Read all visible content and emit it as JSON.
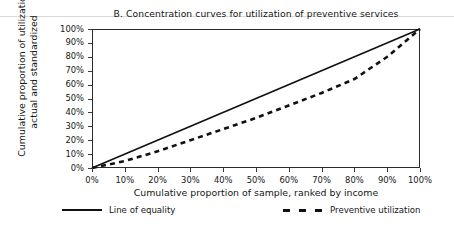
{
  "chart_data": {
    "type": "line",
    "title": "B.  Concentration curves for utilization of preventive services",
    "xlabel": "Cumulative proportion of sample, ranked by income",
    "ylabel_line1": "Cumulative proportion of utilization,",
    "ylabel_line2": "actual and standardized",
    "xlim": [
      0,
      100
    ],
    "ylim": [
      0,
      100
    ],
    "grid": false,
    "legend_position": "bottom",
    "xticks": [
      "0%",
      "10%",
      "20%",
      "30%",
      "40%",
      "50%",
      "60%",
      "70%",
      "80%",
      "90%",
      "100%"
    ],
    "yticks": [
      "0%",
      "10%",
      "20%",
      "30%",
      "40%",
      "50%",
      "60%",
      "70%",
      "80%",
      "90%",
      "100%"
    ],
    "xtick_values": [
      0,
      10,
      20,
      30,
      40,
      50,
      60,
      70,
      80,
      90,
      100
    ],
    "ytick_values": [
      0,
      10,
      20,
      30,
      40,
      50,
      60,
      70,
      80,
      90,
      100
    ],
    "series": [
      {
        "name": "Line of equality",
        "style": "solid",
        "color": "#111111",
        "x": [
          0,
          100
        ],
        "values": [
          0,
          100
        ]
      },
      {
        "name": "Preventive utilization",
        "style": "dashed",
        "color": "#111111",
        "x": [
          0,
          10,
          20,
          30,
          40,
          50,
          60,
          70,
          80,
          90,
          100
        ],
        "values": [
          0,
          5,
          12,
          20,
          28,
          36,
          45,
          54,
          64,
          80,
          100
        ]
      }
    ]
  },
  "legend": {
    "items": [
      {
        "label": "Line of equality"
      },
      {
        "label": "Preventive utilization"
      }
    ]
  }
}
